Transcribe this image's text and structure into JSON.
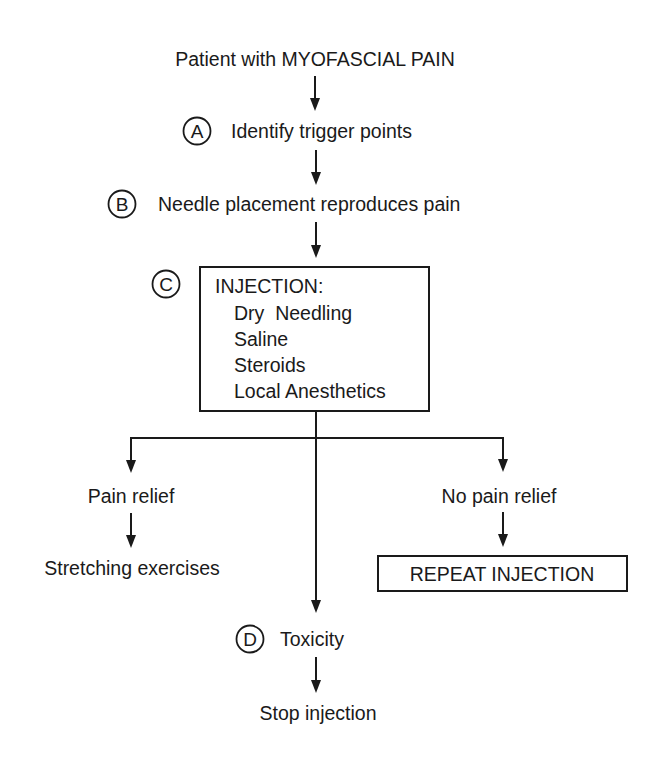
{
  "diagram": {
    "title_node": "Patient with MYOFASCIAL PAIN",
    "steps": [
      {
        "marker": "A",
        "label": "Identify trigger points"
      },
      {
        "marker": "B",
        "label": "Needle placement reproduces pain"
      }
    ],
    "injection_box": {
      "marker": "C",
      "heading": "INJECTION:",
      "options": [
        "Dry  Needling",
        "Saline",
        "Steroids",
        "Local Anesthetics"
      ]
    },
    "branches": {
      "left": {
        "label": "Pain relief",
        "outcome": "Stretching exercises"
      },
      "right": {
        "label": "No pain relief",
        "outcome": "REPEAT INJECTION"
      },
      "center": {
        "marker": "D",
        "label": "Toxicity",
        "outcome": "Stop injection"
      }
    },
    "colors": {
      "ink": "#1a1a1a",
      "background": "#ffffff"
    }
  }
}
